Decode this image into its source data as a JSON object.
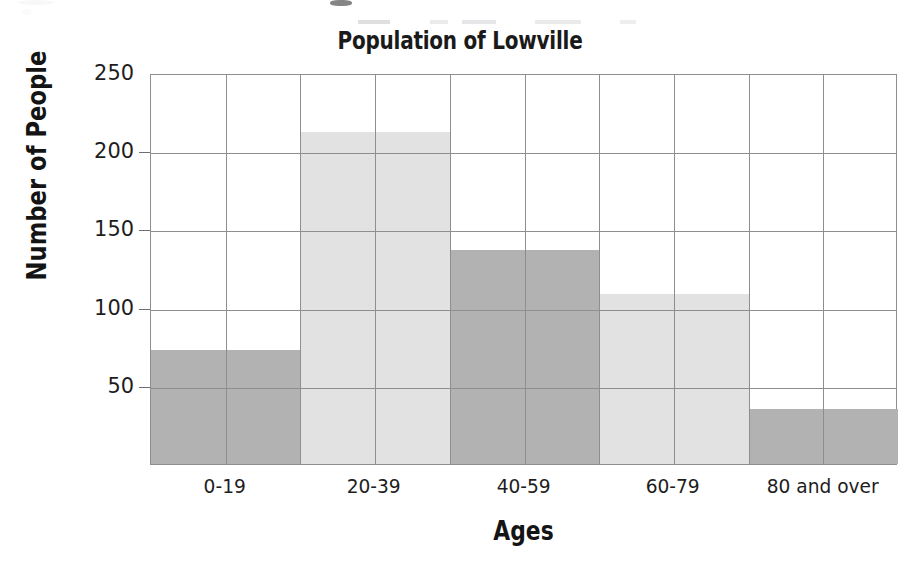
{
  "chart_data": {
    "type": "bar",
    "title": "Population of Lowville",
    "xlabel": "Ages",
    "ylabel": "Number of People",
    "categories": [
      "0-19",
      "20-39",
      "40-59",
      "60-79",
      "80 and over"
    ],
    "values": [
      73,
      212,
      137,
      109,
      35
    ],
    "ylim": [
      0,
      250
    ],
    "yticks": [
      50,
      100,
      150,
      200,
      250
    ],
    "ytick_labels": [
      "50",
      "100",
      "150",
      "200",
      "250"
    ],
    "grid": "both",
    "grid_columns": 10,
    "legend": "none",
    "bar_colors": [
      "#b2b2b2",
      "#e2e2e2",
      "#b2b2b2",
      "#e2e2e2",
      "#b2b2b2"
    ],
    "series": [
      {
        "name": "Number of People",
        "values": [
          73,
          212,
          137,
          109,
          35
        ]
      }
    ],
    "bars": [
      {
        "label": "0-19",
        "value": 73,
        "color": "#b2b2b2"
      },
      {
        "label": "20-39",
        "value": 212,
        "color": "#e2e2e2"
      },
      {
        "label": "40-59",
        "value": 137,
        "color": "#b2b2b2"
      },
      {
        "label": "60-79",
        "value": 109,
        "color": "#e2e2e2"
      },
      {
        "label": "80 and over",
        "value": 35,
        "color": "#b2b2b2"
      }
    ],
    "axis_color": "#8e8e8e",
    "text_color": "#1a1a1a"
  }
}
